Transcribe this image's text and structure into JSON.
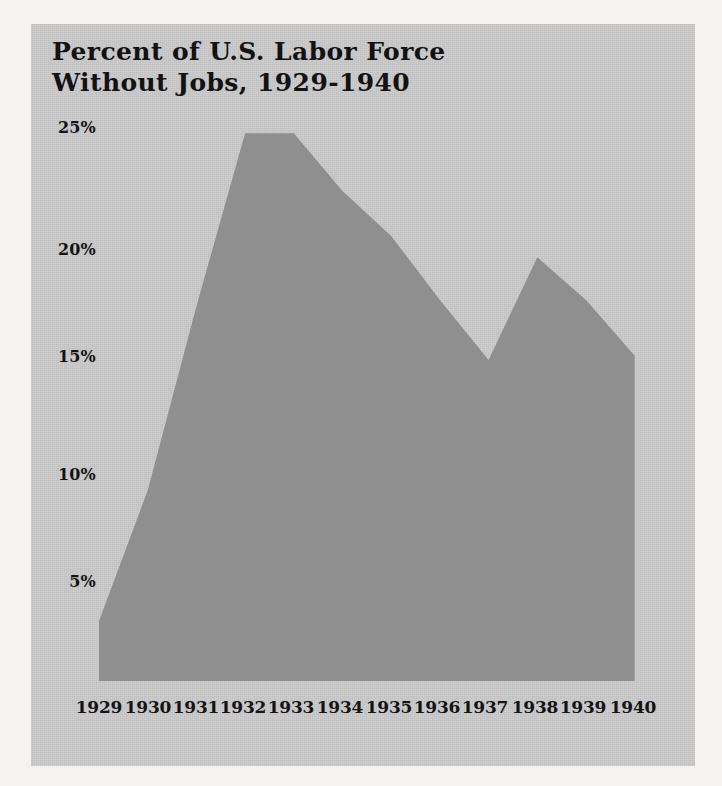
{
  "figure": {
    "title_line_1": "Percent of U.S. Labor Force",
    "title_line_2": "Without Jobs, 1929-1940",
    "title": "Percent of U.S. Labor Force\nWithout Jobs, 1929-1940",
    "panel_background_color": "#c9c9c9",
    "page_background_color": "#f4f3f1",
    "area_fill_color": "#8f8f8f",
    "text_color": "#131313"
  },
  "chart_data": {
    "type": "area",
    "title": "Percent of U.S. Labor Force Without Jobs, 1929-1940",
    "xlabel": "",
    "ylabel": "",
    "categories": [
      "1929",
      "1930",
      "1931",
      "1932",
      "1933",
      "1934",
      "1935",
      "1936",
      "1937",
      "1938",
      "1939",
      "1940"
    ],
    "values": [
      2.8,
      8.9,
      17.5,
      25.6,
      25.6,
      22.9,
      20.8,
      17.8,
      15.0,
      19.8,
      17.8,
      15.2
    ],
    "ylim": [
      0,
      27.5
    ],
    "ytick_values": [
      5,
      10,
      15,
      20,
      25
    ],
    "ytick_labels": [
      "5%",
      "10%",
      "15%",
      "20%",
      "25%"
    ],
    "grid": false,
    "legend": null,
    "series": [
      {
        "name": "Unemployment rate",
        "values": [
          2.8,
          8.9,
          17.5,
          25.6,
          25.6,
          22.9,
          20.8,
          17.8,
          15.0,
          19.8,
          17.8,
          15.2
        ]
      }
    ]
  },
  "axes": {
    "y_ticks": [
      {
        "label": "25%",
        "value": 25
      },
      {
        "label": "20%",
        "value": 20
      },
      {
        "label": "15%",
        "value": 15
      },
      {
        "label": "10%",
        "value": 10
      },
      {
        "label": "5%",
        "value": 5
      }
    ],
    "x_ticks": [
      {
        "label": "1929"
      },
      {
        "label": "1930"
      },
      {
        "label": "1931"
      },
      {
        "label": "1932"
      },
      {
        "label": "1933"
      },
      {
        "label": "1934"
      },
      {
        "label": "1935"
      },
      {
        "label": "1936"
      },
      {
        "label": "1937"
      },
      {
        "label": "1938"
      },
      {
        "label": "1939"
      },
      {
        "label": "1940"
      }
    ]
  }
}
